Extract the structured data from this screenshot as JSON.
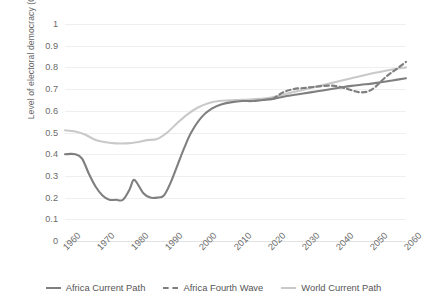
{
  "chart_data": {
    "type": "line",
    "title": "",
    "xlabel": "",
    "ylabel": "Level of electoral democracy (0 to 1)",
    "xlim": [
      1960,
      2060
    ],
    "ylim": [
      0,
      1
    ],
    "grid": true,
    "legend_position": "bottom",
    "y_ticks": [
      "1",
      "0.9",
      "0.8",
      "0.7",
      "0.6",
      "0.5",
      "0.4",
      "0.3",
      "0.2",
      "0.1",
      "0"
    ],
    "y_tick_values": [
      1,
      0.9,
      0.8,
      0.7,
      0.6,
      0.5,
      0.4,
      0.3,
      0.2,
      0.1,
      0
    ],
    "x_ticks": [
      "1960",
      "1970",
      "1980",
      "1990",
      "2000",
      "2010",
      "2020",
      "2030",
      "2040",
      "2050",
      "2060"
    ],
    "x_tick_values": [
      1960,
      1970,
      1980,
      1990,
      2000,
      2010,
      2020,
      2030,
      2040,
      2050,
      2060
    ],
    "colors": {
      "africa_current_path": "#7f7f7f",
      "africa_fourth_wave": "#7f7f7f",
      "world_current_path": "#c9c9c9",
      "gridline": "#efefef",
      "text": "#6b6b6b"
    },
    "series": [
      {
        "name": "Africa Current Path",
        "style": "solid",
        "color": "#7f7f7f",
        "x": [
          1960,
          1963,
          1965,
          1967,
          1969,
          1971,
          1973,
          1975,
          1977,
          1979,
          1980,
          1981,
          1983,
          1985,
          1987,
          1989,
          1991,
          1993,
          1995,
          1997,
          2000,
          2003,
          2006,
          2009,
          2012,
          2015,
          2018,
          2021,
          2024,
          2028,
          2032,
          2036,
          2040,
          2044,
          2048,
          2052,
          2056,
          2060
        ],
        "values": [
          0.4,
          0.4,
          0.38,
          0.31,
          0.25,
          0.21,
          0.19,
          0.19,
          0.19,
          0.24,
          0.28,
          0.27,
          0.22,
          0.2,
          0.2,
          0.21,
          0.27,
          0.35,
          0.43,
          0.5,
          0.57,
          0.61,
          0.63,
          0.64,
          0.645,
          0.645,
          0.65,
          0.655,
          0.665,
          0.675,
          0.685,
          0.695,
          0.705,
          0.715,
          0.722,
          0.73,
          0.74,
          0.75
        ]
      },
      {
        "name": "Africa Fourth Wave",
        "style": "dashed",
        "color": "#7f7f7f",
        "x": [
          2021,
          2024,
          2027,
          2030,
          2033,
          2036,
          2039,
          2042,
          2045,
          2047,
          2049,
          2051,
          2054,
          2057,
          2060
        ],
        "values": [
          0.655,
          0.685,
          0.7,
          0.705,
          0.71,
          0.715,
          0.715,
          0.705,
          0.69,
          0.685,
          0.69,
          0.71,
          0.755,
          0.79,
          0.825
        ]
      },
      {
        "name": "World Current Path",
        "style": "solid",
        "color": "#c9c9c9",
        "x": [
          1960,
          1963,
          1966,
          1969,
          1972,
          1975,
          1978,
          1981,
          1984,
          1987,
          1990,
          1993,
          1996,
          1999,
          2002,
          2005,
          2008,
          2011,
          2014,
          2017,
          2020,
          2024,
          2028,
          2032,
          2036,
          2040,
          2044,
          2048,
          2052,
          2056,
          2060
        ],
        "values": [
          0.51,
          0.505,
          0.49,
          0.465,
          0.455,
          0.45,
          0.45,
          0.455,
          0.465,
          0.47,
          0.5,
          0.545,
          0.585,
          0.615,
          0.635,
          0.645,
          0.648,
          0.65,
          0.652,
          0.655,
          0.66,
          0.675,
          0.69,
          0.705,
          0.72,
          0.735,
          0.75,
          0.765,
          0.778,
          0.79,
          0.8
        ]
      }
    ]
  },
  "legend": {
    "items": [
      {
        "label": "Africa Current Path",
        "style": "solid",
        "color": "#7f7f7f"
      },
      {
        "label": "Africa Fourth Wave",
        "style": "dashed",
        "color": "#7f7f7f"
      },
      {
        "label": "World Current Path",
        "style": "solid",
        "color": "#c9c9c9"
      }
    ]
  }
}
